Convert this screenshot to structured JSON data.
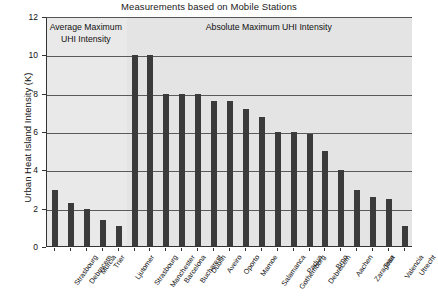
{
  "chart_data": {
    "type": "bar",
    "title": "Measurements based on Mobile Stations",
    "xlabel": "",
    "ylabel": "Urban Heat Island Intensity (K)",
    "ylim": [
      0,
      12
    ],
    "yticks": [
      0,
      2,
      4,
      6,
      8,
      10,
      12
    ],
    "grid": true,
    "legend": "none",
    "annotations": [
      "Average Maximum UHI Intensity",
      "Absolute Maximum UHI Intensity"
    ],
    "groups": [
      {
        "name": "Average Maximum UHI Intensity",
        "categories": [
          "Strasbourg",
          "Debrecem",
          "Murcia",
          "Trier",
          "Ljutomer"
        ],
        "values": [
          3.0,
          2.3,
          2.0,
          1.4,
          1.1
        ]
      },
      {
        "name": "Absolute Maximum UHI Intensity",
        "categories": [
          "Strasbourg",
          "Manchester",
          "Barcelona",
          "Bucharest",
          "Dublin",
          "Aveiro",
          "Oporto",
          "Mamoe",
          "Salamanca",
          "Gothemborg",
          "Padua",
          "Debrecem",
          "Brno",
          "Aachen",
          "Zaragosa",
          "Trier",
          "Valencia",
          "Utrecht"
        ],
        "values": [
          10.0,
          10.0,
          8.0,
          8.0,
          8.0,
          7.6,
          7.6,
          7.2,
          6.8,
          6.0,
          6.0,
          5.9,
          5.0,
          4.0,
          3.0,
          2.6,
          2.5,
          1.1
        ]
      }
    ],
    "categories": [
      "Strasbourg",
      "Debrecem",
      "Murcia",
      "Trier",
      "Ljutomer",
      "Strasbourg",
      "Manchester",
      "Barcelona",
      "Bucharest",
      "Dublin",
      "Aveiro",
      "Oporto",
      "Mamoe",
      "Salamanca",
      "Gothemborg",
      "Padua",
      "Debrecem",
      "Brno",
      "Aachen",
      "Zaragosa",
      "Trier",
      "Valencia",
      "Utrecht"
    ],
    "values": [
      3.0,
      2.3,
      2.0,
      1.4,
      1.1,
      10.0,
      10.0,
      8.0,
      8.0,
      8.0,
      7.6,
      7.6,
      7.2,
      6.8,
      6.0,
      6.0,
      5.9,
      5.0,
      4.0,
      3.0,
      2.6,
      2.5,
      1.1
    ],
    "colors": {
      "bar": "#3b3b3b",
      "band_left": "#e9e9e9",
      "band_right": "#e4e4e4",
      "grid": "#5a5a5a",
      "axis": "#333333",
      "text": "#111111",
      "background": "#ffffff"
    }
  }
}
